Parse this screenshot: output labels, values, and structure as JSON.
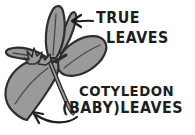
{
  "diagram": {
    "labels": {
      "true_line1": "TRUE",
      "true_line2": "LEAVES",
      "cotyledon_line1": "COTYLEDON",
      "cotyledon_line2": "(BABY)LEAVES"
    },
    "icons": {
      "true_leaves_pointer": "left-arrow",
      "cotyledon_pointer": "curved-up-left-arrow"
    },
    "colors": {
      "background": "#ffffff",
      "leaf_fill": "#9a9a9a",
      "outline": "#2e2e2e",
      "ink": "#1d1d1d"
    }
  }
}
